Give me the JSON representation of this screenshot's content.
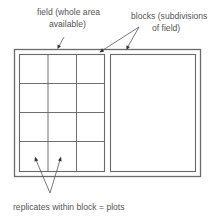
{
  "labels": {
    "field_line1": "field (whole area",
    "field_line2": "available)",
    "blocks_line1": "blocks (subdivisions",
    "blocks_line2": "of field)",
    "plots": "replicates within block = plots"
  },
  "layout_semantics": {
    "blocks": 2,
    "plot_grid_rows": 4,
    "plot_grid_cols": 3
  }
}
